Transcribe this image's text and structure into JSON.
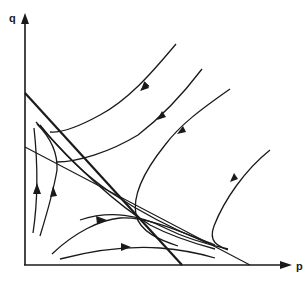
{
  "diagram": {
    "type": "phase-portrait",
    "axes": {
      "x_label": "p",
      "y_label": "q"
    },
    "isoclines": [
      {
        "name": "thick-isocline",
        "style": "thick"
      },
      {
        "name": "thin-isocline",
        "style": "thin"
      }
    ],
    "trajectory_count": 11,
    "color": "#1a1a1a"
  }
}
